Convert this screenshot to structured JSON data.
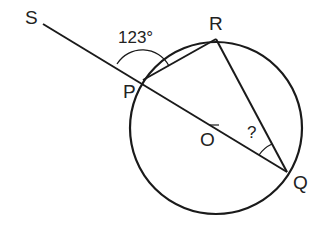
{
  "diagram": {
    "type": "circle-geometry",
    "colors": {
      "stroke": "#1a1a1a",
      "text": "#222222",
      "background": "#ffffff"
    },
    "circle": {
      "center_label": "O",
      "cx": 216,
      "cy": 128,
      "r": 86
    },
    "points": {
      "S": {
        "label": "S",
        "x": 43,
        "y": 24
      },
      "P": {
        "label": "P",
        "x": 143,
        "y": 80
      },
      "R": {
        "label": "R",
        "x": 216,
        "y": 39
      },
      "Q": {
        "label": "Q",
        "x": 287,
        "y": 172
      },
      "O": {
        "label": "O",
        "x": 216,
        "y": 128
      }
    },
    "segments": [
      {
        "name": "line-SQ",
        "from": "S",
        "to": "Q",
        "note": "passes through P and O"
      },
      {
        "name": "chord-PR",
        "from": "P",
        "to": "R"
      },
      {
        "name": "chord-RQ",
        "from": "R",
        "to": "Q"
      }
    ],
    "angles": [
      {
        "name": "angle-SPR",
        "label": "123°",
        "vertex": "P"
      },
      {
        "name": "angle-RQP",
        "label": "?",
        "vertex": "Q"
      }
    ]
  }
}
